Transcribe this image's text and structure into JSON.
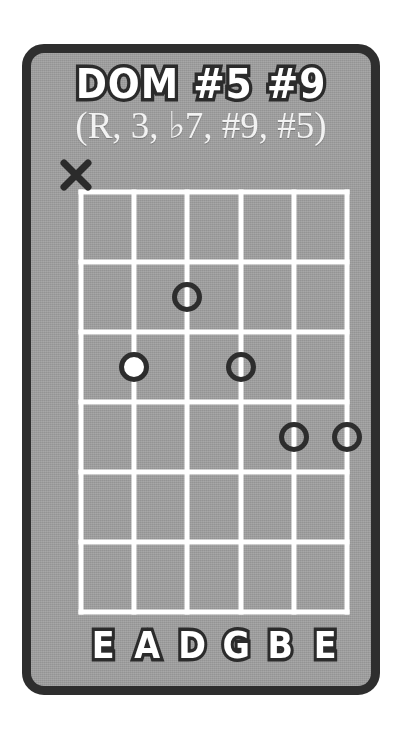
{
  "card": {
    "background_color": "#9b9b9b",
    "border_color": "#2e2e2e"
  },
  "header": {
    "title": "DOM #5 #9",
    "formula": "(R, 3, ♭7, #9, #5)"
  },
  "diagram": {
    "type": "guitar-chord-diagram",
    "string_count": 6,
    "fret_count": 6,
    "line_color": "#ffffff",
    "dot_outline_color": "#2d2d2d",
    "root_dot_fill": "#ffffff",
    "string_names": [
      "E",
      "A",
      "D",
      "G",
      "B",
      "E"
    ],
    "markers": [
      {
        "label": "X",
        "string": 1,
        "meaning": "muted"
      }
    ],
    "dots": [
      {
        "string": 3,
        "fret": 2,
        "style": "open",
        "string_name": "D"
      },
      {
        "string": 2,
        "fret": 3,
        "style": "filled",
        "string_name": "A"
      },
      {
        "string": 4,
        "fret": 3,
        "style": "open",
        "string_name": "G"
      },
      {
        "string": 5,
        "fret": 4,
        "style": "open",
        "string_name": "B"
      },
      {
        "string": 6,
        "fret": 4,
        "style": "open",
        "string_name": "E"
      }
    ]
  }
}
